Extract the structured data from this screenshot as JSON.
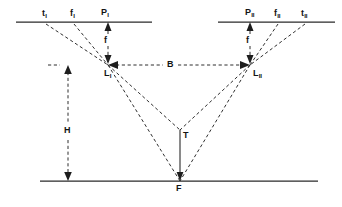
{
  "figure": {
    "type": "optics-photogrammetry-stereo-diagram",
    "background_color": "#ffffff",
    "line_color": "#2a2a2a",
    "dash_color": "#2f2f2f"
  },
  "labels": {
    "left_plate": {
      "t": "t",
      "t_sub": "I",
      "f": "f",
      "f_sub": "I",
      "p": "P",
      "p_sub": "I"
    },
    "right_plate": {
      "p": "P",
      "p_sub": "II",
      "f": "f",
      "f_sub": "II",
      "t": "t",
      "t_sub": "II"
    },
    "focal_left": "f",
    "focal_right": "f",
    "lens_left": "L",
    "lens_left_sub": "I",
    "lens_right": "L",
    "lens_right_sub": "II",
    "baseline": "B",
    "height": "H",
    "tower": "T",
    "ground_point": "F"
  },
  "geometry": {
    "top_line_y": 22,
    "left_plate_x1": 16,
    "left_plate_x2": 152,
    "right_plate_x1": 218,
    "right_plate_x2": 335,
    "bottom_line_y": 181,
    "bottom_line_x1": 40,
    "bottom_line_x2": 318,
    "lens_left_x": 108,
    "lens_left_y": 65,
    "lens_right_x": 250,
    "lens_right_y": 65,
    "focus_x": 180,
    "focus_y": 181,
    "tower_top_y": 130,
    "height_dim_x": 68,
    "t_left_plate_x": 46,
    "f_left_plate_x": 74,
    "p_left_plate_x": 105,
    "p_right_plate_x": 250,
    "f_right_plate_x": 278,
    "t_right_plate_x": 305
  }
}
